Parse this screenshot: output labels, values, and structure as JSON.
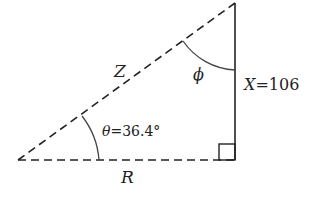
{
  "diagram": {
    "type": "right-triangle",
    "labels": {
      "hypotenuse": "Z",
      "base": "R",
      "vertical_name": "X",
      "vertical_eq": "=106",
      "theta_sym": "θ",
      "theta_eq": "=36.4°",
      "phi": "ϕ"
    },
    "colors": {
      "line": "#222222",
      "background": "#ffffff"
    }
  }
}
